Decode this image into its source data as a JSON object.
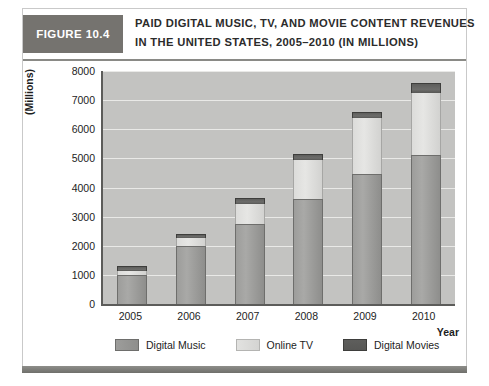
{
  "figure": {
    "number_label": "FIGURE 10.4",
    "title_line1": "PAID DIGITAL MUSIC, TV, AND MOVIE CONTENT REVENUES",
    "title_line2": "IN THE UNITED STATES, 2005–2010 (IN MILLIONS)"
  },
  "colors": {
    "header_block": "#75736f",
    "plot_background": "#c3c3c1",
    "gridline": "#e9e9e7",
    "digital_music": "#9d9d9b",
    "online_tv": "#e0e0de",
    "digital_movies": "#5e5e5c",
    "axis": "#5c5c5a",
    "footer_rule": "#7f7f7b"
  },
  "legend": {
    "items": [
      {
        "label": "Digital Music",
        "swatch": "digital-music-swatch"
      },
      {
        "label": "Online TV",
        "swatch": "online-tv-swatch"
      },
      {
        "label": "Digital Movies",
        "swatch": "digital-movies-swatch"
      }
    ]
  },
  "axes": {
    "y_title": "(Millions)",
    "x_title": "Year",
    "y_ticks": [
      "8000",
      "7000",
      "6000",
      "5000",
      "4000",
      "3000",
      "2000",
      "1000",
      "0"
    ],
    "x_ticks": [
      "2005",
      "2006",
      "2007",
      "2008",
      "2009",
      "2010"
    ]
  },
  "chart_data": {
    "type": "bar",
    "stacked": true,
    "title": "PAID DIGITAL MUSIC, TV, AND MOVIE CONTENT REVENUES IN THE UNITED STATES, 2005–2010 (IN MILLIONS)",
    "xlabel": "Year",
    "ylabel": "(Millions)",
    "ylim": [
      0,
      8000
    ],
    "ytick_step": 1000,
    "grid": true,
    "legend_position": "bottom",
    "categories": [
      "2005",
      "2006",
      "2007",
      "2008",
      "2009",
      "2010"
    ],
    "series": [
      {
        "name": "Digital Music",
        "values": [
          1000,
          2000,
          2750,
          3600,
          4450,
          5100
        ]
      },
      {
        "name": "Online TV",
        "values": [
          150,
          250,
          700,
          1350,
          1950,
          2150
        ]
      },
      {
        "name": "Digital Movies",
        "values": [
          150,
          150,
          200,
          200,
          200,
          350
        ]
      }
    ],
    "totals": [
      1300,
      2400,
      3650,
      5150,
      6600,
      7600
    ]
  }
}
